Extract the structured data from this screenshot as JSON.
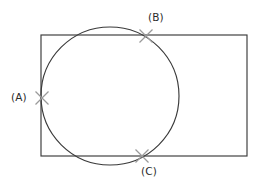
{
  "figure": {
    "background_color": "#ffffff",
    "width": 262,
    "height": 183,
    "shape_stroke_color": "#3a3a3a",
    "marker_stroke_color": "#9a9a9a",
    "label_text_color": "#2b2b2b"
  },
  "shapes": {
    "rectangle": {
      "name": "rectangle",
      "x": 41,
      "y": 35,
      "width": 206,
      "height": 121,
      "stroke_width": 1.15
    },
    "circle": {
      "name": "circle",
      "cx": 110,
      "cy": 96,
      "r": 69,
      "stroke_width": 1.15
    }
  },
  "markers": [
    {
      "id": "A",
      "label": "(A)",
      "x": 42,
      "y": 98,
      "size": 13,
      "label_x": 11,
      "label_y": 92,
      "location": "left-edge-intersection"
    },
    {
      "id": "B",
      "label": "(B)",
      "x": 146,
      "y": 36,
      "size": 13,
      "label_x": 148,
      "label_y": 12,
      "location": "top-edge-intersection"
    },
    {
      "id": "C",
      "label": "(C)",
      "x": 142,
      "y": 156,
      "size": 13,
      "label_x": 141,
      "label_y": 166,
      "location": "bottom-edge-intersection"
    }
  ]
}
